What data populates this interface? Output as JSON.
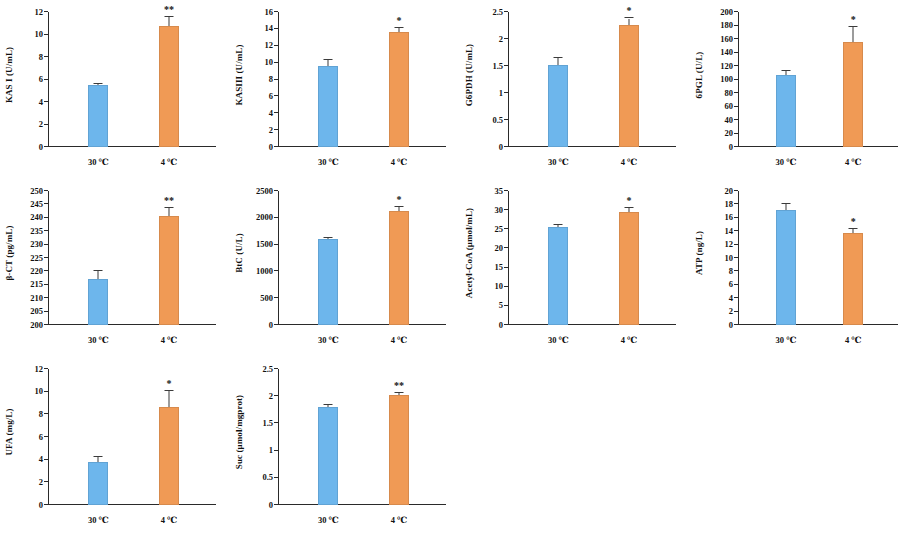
{
  "figure": {
    "background_color": "#ffffff",
    "series_colors": {
      "control": "#6db6ec",
      "cold": "#f09a55"
    },
    "panel_count": 10,
    "columns": 4,
    "rows": 3
  },
  "chart_data": [
    {
      "type": "bar",
      "name": "kas-i",
      "title": "",
      "ylabel": "KAS I (U/mL)",
      "xlabel": "",
      "categories": [
        "30 ℃",
        "4 ℃"
      ],
      "values": [
        5.5,
        10.75
      ],
      "errors": [
        0.12,
        0.85
      ],
      "annotations": [
        "",
        "**"
      ],
      "ylim": [
        0,
        12
      ],
      "yticks": [
        0,
        2,
        4,
        6,
        8,
        10,
        12
      ],
      "ytick_labels": [
        "0",
        "2",
        "4",
        "6",
        "8",
        "10",
        "12"
      ],
      "grid": false,
      "legend": "none"
    },
    {
      "type": "bar",
      "name": "kas-iii",
      "title": "",
      "ylabel": "KASIII (U/mL)",
      "xlabel": "",
      "categories": [
        "30 ℃",
        "4 ℃"
      ],
      "values": [
        9.6,
        13.6
      ],
      "errors": [
        0.7,
        0.55
      ],
      "annotations": [
        "",
        "*"
      ],
      "ylim": [
        0,
        16
      ],
      "yticks": [
        0,
        2,
        4,
        6,
        8,
        10,
        12,
        14,
        16
      ],
      "ytick_labels": [
        "0",
        "2",
        "4",
        "6",
        "8",
        "10",
        "12",
        "14",
        "16"
      ],
      "grid": false,
      "legend": "none"
    },
    {
      "type": "bar",
      "name": "g6pdh",
      "title": "",
      "ylabel": "G6PDH (U/mL)",
      "xlabel": "",
      "categories": [
        "30 ℃",
        "4 ℃"
      ],
      "values": [
        1.52,
        2.26
      ],
      "errors": [
        0.12,
        0.12
      ],
      "annotations": [
        "",
        "*"
      ],
      "ylim": [
        0,
        2.5
      ],
      "yticks": [
        0,
        0.5,
        1,
        1.5,
        2,
        2.5
      ],
      "ytick_labels": [
        "0",
        "0.5",
        "1",
        "1.5",
        "2",
        "2.5"
      ],
      "grid": false,
      "legend": "none"
    },
    {
      "type": "bar",
      "name": "6pgl",
      "title": "",
      "ylabel": "6PGL (U/L)",
      "xlabel": "",
      "categories": [
        "30 ℃",
        "4 ℃"
      ],
      "values": [
        106,
        156
      ],
      "errors": [
        6,
        22
      ],
      "annotations": [
        "",
        "*"
      ],
      "ylim": [
        0,
        200
      ],
      "yticks": [
        0,
        20,
        40,
        60,
        80,
        100,
        120,
        140,
        160,
        180,
        200
      ],
      "ytick_labels": [
        "0",
        "20",
        "40",
        "60",
        "80",
        "100",
        "120",
        "140",
        "160",
        "180",
        "200"
      ],
      "grid": false,
      "legend": "none"
    },
    {
      "type": "bar",
      "name": "beta-ct",
      "title": "",
      "ylabel": "β-CT (pg/mL)",
      "xlabel": "",
      "categories": [
        "30 ℃",
        "4 ℃"
      ],
      "values": [
        217,
        240.5
      ],
      "errors": [
        3.2,
        3.0
      ],
      "annotations": [
        "",
        "**"
      ],
      "ylim": [
        200,
        250
      ],
      "yticks": [
        200,
        205,
        210,
        215,
        220,
        225,
        230,
        235,
        240,
        245,
        250
      ],
      "ytick_labels": [
        "200",
        "205",
        "210",
        "215",
        "220",
        "225",
        "230",
        "235",
        "240",
        "245",
        "250"
      ],
      "grid": false,
      "legend": "none"
    },
    {
      "type": "bar",
      "name": "btc",
      "title": "",
      "ylabel": "BtC (U/L)",
      "xlabel": "",
      "categories": [
        "30 ℃",
        "4 ℃"
      ],
      "values": [
        1600,
        2125
      ],
      "errors": [
        25,
        85
      ],
      "annotations": [
        "",
        "*"
      ],
      "ylim": [
        0,
        2500
      ],
      "yticks": [
        0,
        500,
        1000,
        1500,
        2000,
        2500
      ],
      "ytick_labels": [
        "0",
        "500",
        "1000",
        "1500",
        "2000",
        "2500"
      ],
      "grid": false,
      "legend": "none"
    },
    {
      "type": "bar",
      "name": "acetyl-coa",
      "title": "",
      "ylabel": "Acetyl-CoA (μmol/mL)",
      "xlabel": "",
      "categories": [
        "30 ℃",
        "4 ℃"
      ],
      "values": [
        25.5,
        29.5
      ],
      "errors": [
        0.5,
        1.0
      ],
      "annotations": [
        "",
        "*"
      ],
      "ylim": [
        0,
        35
      ],
      "yticks": [
        0,
        5,
        10,
        15,
        20,
        25,
        30,
        35
      ],
      "ytick_labels": [
        "0",
        "5",
        "10",
        "15",
        "20",
        "25",
        "30",
        "35"
      ],
      "grid": false,
      "legend": "none"
    },
    {
      "type": "bar",
      "name": "atp",
      "title": "",
      "ylabel": "ATP (ng/L)",
      "xlabel": "",
      "categories": [
        "30 ℃",
        "4 ℃"
      ],
      "values": [
        17.1,
        13.8
      ],
      "errors": [
        0.9,
        0.5
      ],
      "annotations": [
        "",
        "*"
      ],
      "ylim": [
        0,
        20
      ],
      "yticks": [
        0,
        2,
        4,
        6,
        8,
        10,
        12,
        14,
        16,
        18,
        20
      ],
      "ytick_labels": [
        "0",
        "2",
        "4",
        "6",
        "8",
        "10",
        "12",
        "14",
        "16",
        "18",
        "20"
      ],
      "grid": false,
      "legend": "none"
    },
    {
      "type": "bar",
      "name": "ufa",
      "title": "",
      "ylabel": "UFA (mg/L)",
      "xlabel": "",
      "categories": [
        "30 ℃",
        "4 ℃"
      ],
      "values": [
        3.8,
        8.65
      ],
      "errors": [
        0.45,
        1.45
      ],
      "annotations": [
        "",
        "*"
      ],
      "ylim": [
        0,
        12
      ],
      "yticks": [
        0,
        2,
        4,
        6,
        8,
        10,
        12
      ],
      "ytick_labels": [
        "0",
        "2",
        "4",
        "6",
        "8",
        "10",
        "12"
      ],
      "grid": false,
      "legend": "none"
    },
    {
      "type": "bar",
      "name": "suc",
      "title": "",
      "ylabel": "Suc (μmol/mgprot)",
      "xlabel": "",
      "categories": [
        "30 ℃",
        "4 ℃"
      ],
      "values": [
        1.81,
        2.02
      ],
      "errors": [
        0.03,
        0.04
      ],
      "annotations": [
        "",
        "**"
      ],
      "ylim": [
        0,
        2.5
      ],
      "yticks": [
        0,
        0.5,
        1,
        1.5,
        2,
        2.5
      ],
      "ytick_labels": [
        "0",
        "0.5",
        "1",
        "1.5",
        "2",
        "2.5"
      ],
      "grid": false,
      "legend": "none"
    }
  ]
}
